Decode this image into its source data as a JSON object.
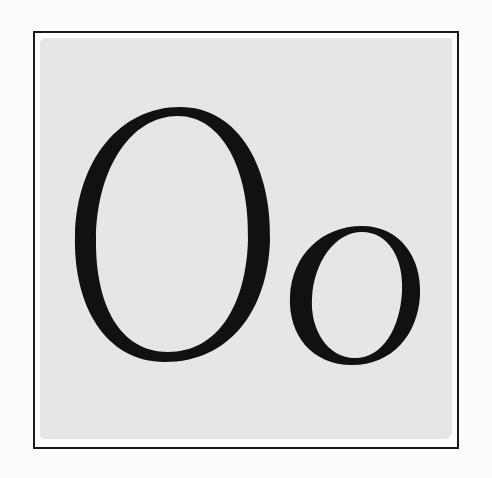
{
  "illustration": {
    "title": "Oo",
    "uppercase_letter": "O",
    "lowercase_letter": "o",
    "style": "hand-inked serif letters on grey watercolor wash inside a drawn square frame",
    "colors": {
      "ink": "#111111",
      "wash": "#e6e6e6",
      "paper": "#fbfbfb",
      "frame": "#1a1a1a"
    }
  }
}
